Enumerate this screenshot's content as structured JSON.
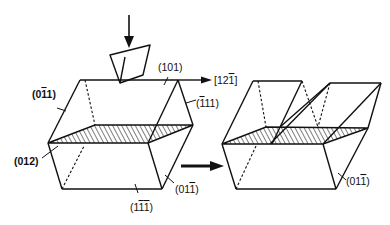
{
  "figure": {
    "left_crystal": {
      "labels": {
        "top_face": "(101)",
        "left_face": "(0̅1 1)",
        "right_face": "(̅1 11)",
        "shear_plane": "(012)",
        "front_right_face": "(01̅1)",
        "bottom_face": "(1̅1̅1)"
      }
    },
    "direction_label": "[12̅1]",
    "right_crystal": {
      "labels": {
        "front_right_face": "(01̅1)"
      }
    },
    "arrows": [
      "load-arrow",
      "shear-direction-arrow",
      "transformation-arrow"
    ]
  }
}
